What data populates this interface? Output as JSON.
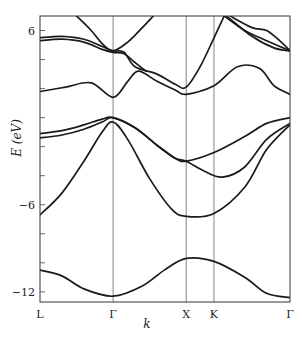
{
  "chart_data": {
    "type": "line",
    "title": "",
    "xlabel": "k",
    "ylabel": "E (eV)",
    "ylim": [
      -12.7,
      7.0
    ],
    "grid": false,
    "legend": null,
    "x_ticks": [
      {
        "label": "L",
        "pos": 0
      },
      {
        "label": "Γ",
        "pos": 1
      },
      {
        "label": "X",
        "pos": 2
      },
      {
        "label": "K",
        "pos": 2.38
      },
      {
        "label": "Γ",
        "pos": 3.42
      }
    ],
    "y_ticks_labeled": [
      6,
      -6,
      -12
    ],
    "y_ticks_minor": [
      6,
      4,
      2,
      0,
      -2,
      -4,
      -6,
      -8,
      -10,
      -12
    ],
    "series": [
      {
        "name": "band-1",
        "x": [
          0,
          0.3,
          0.6,
          1.0,
          1.4,
          1.7,
          2.0,
          2.38,
          2.8,
          3.1,
          3.42
        ],
        "y": [
          -10.5,
          -10.9,
          -11.8,
          -12.3,
          -11.6,
          -10.5,
          -9.7,
          -9.9,
          -11.0,
          -12.1,
          -12.4
        ]
      },
      {
        "name": "band-2",
        "x": [
          0,
          0.3,
          0.6,
          0.85,
          1.0,
          1.2,
          1.5,
          1.8,
          2.0,
          2.38,
          2.8,
          3.1,
          3.42
        ],
        "y": [
          -6.7,
          -5.2,
          -3.0,
          -1.0,
          -0.3,
          -1.5,
          -4.2,
          -6.3,
          -6.8,
          -6.6,
          -4.8,
          -2.2,
          -0.5
        ]
      },
      {
        "name": "band-3a",
        "x": [
          0,
          0.3,
          0.6,
          0.85,
          1.0,
          1.3,
          1.6,
          1.85,
          2.0,
          2.38,
          2.8,
          3.1,
          3.42
        ],
        "y": [
          -1.1,
          -0.9,
          -0.5,
          -0.1,
          0.0,
          -0.7,
          -1.9,
          -2.8,
          -3.0,
          -2.4,
          -1.3,
          -0.4,
          0.0
        ]
      },
      {
        "name": "band-3b",
        "x": [
          0,
          0.3,
          0.6,
          0.85,
          1.0,
          1.3,
          1.6,
          1.85,
          2.0,
          2.25,
          2.5,
          2.8,
          3.1,
          3.42
        ],
        "y": [
          -1.4,
          -1.2,
          -0.8,
          -0.3,
          0.0,
          -0.7,
          -1.9,
          -2.8,
          -3.0,
          -3.7,
          -4.1,
          -3.4,
          -1.5,
          -0.4
        ]
      },
      {
        "name": "band-4",
        "x": [
          0,
          0.35,
          0.7,
          1.0,
          1.2,
          1.35,
          1.6,
          1.85,
          2.0,
          2.38,
          2.7,
          3.0,
          3.2,
          3.42
        ],
        "y": [
          1.8,
          2.1,
          2.4,
          1.4,
          2.5,
          3.2,
          2.5,
          1.9,
          1.6,
          2.2,
          3.5,
          3.4,
          2.2,
          1.6
        ]
      },
      {
        "name": "band-5",
        "x": [
          0,
          0.3,
          0.6,
          0.85,
          1.0,
          1.15,
          1.3,
          1.6,
          1.85,
          2.0,
          2.2,
          2.38,
          2.52
        ],
        "y": [
          5.5,
          5.6,
          5.4,
          4.9,
          4.6,
          4.5,
          3.5,
          3.0,
          2.3,
          2.1,
          3.6,
          5.5,
          7.0
        ]
      },
      {
        "name": "band-6",
        "x": [
          0,
          0.3,
          0.6,
          0.85,
          1.0,
          1.15,
          1.3,
          1.45
        ],
        "y": [
          5.3,
          5.4,
          5.2,
          4.7,
          4.5,
          4.4,
          3.8,
          3.2
        ]
      },
      {
        "name": "band-7",
        "x": [
          0.5,
          0.7,
          0.85,
          1.0,
          1.2,
          1.4,
          1.55
        ],
        "y": [
          7.0,
          6.0,
          5.1,
          4.6,
          5.2,
          6.2,
          7.0
        ]
      },
      {
        "name": "band-8",
        "x": [
          2.52,
          2.8,
          3.1,
          3.42
        ],
        "y": [
          7.0,
          6.0,
          5.3,
          4.6
        ]
      },
      {
        "name": "band-9",
        "x": [
          2.55,
          2.9,
          3.2,
          3.42
        ],
        "y": [
          7.0,
          5.6,
          4.8,
          4.6
        ]
      },
      {
        "name": "band-10",
        "x": [
          2.6,
          2.9,
          3.1,
          3.3,
          3.42
        ],
        "y": [
          7.0,
          6.2,
          6.0,
          5.2,
          4.6
        ]
      }
    ]
  }
}
